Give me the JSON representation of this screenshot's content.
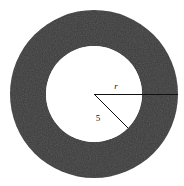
{
  "figure": {
    "background_color": "#ffffff",
    "ring_fill_color": "#3b3b3b",
    "inner_fill_color": "#ffffff",
    "line_color": "#111111"
  },
  "geometry": {
    "center_x": 94,
    "center_y": 94,
    "outer_radius": 84,
    "inner_radius": 48,
    "radius_line_outer": {
      "label": "r",
      "from_x": 94,
      "from_y": 94,
      "to_x": 178,
      "to_y": 94
    },
    "radius_line_inner": {
      "label": "5",
      "from_x": 94,
      "from_y": 94,
      "to_x": 128,
      "to_y": 128
    }
  },
  "labels": {
    "outer_radius_label": "r",
    "inner_radius_label": "5"
  },
  "label_positions": {
    "outer_radius_label_x": 116,
    "outer_radius_label_y": 89,
    "inner_radius_label_x": 98,
    "inner_radius_label_y": 121
  }
}
